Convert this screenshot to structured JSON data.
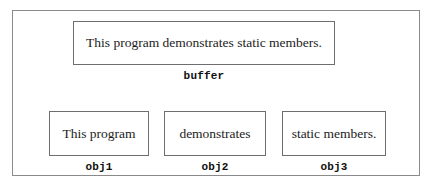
{
  "diagram": {
    "buffer": {
      "box_text": "This program demonstrates static members.",
      "caption": "buffer"
    },
    "objects": [
      {
        "box_text": "This program",
        "caption": "obj1"
      },
      {
        "box_text": "demonstrates",
        "caption": "obj2"
      },
      {
        "box_text": "static members.",
        "caption": "obj3"
      }
    ]
  },
  "colors": {
    "background": "#ffffff",
    "frame_border": "#8a8a8a",
    "box_border": "#6e6e6e",
    "text": "#1c1c1c"
  }
}
